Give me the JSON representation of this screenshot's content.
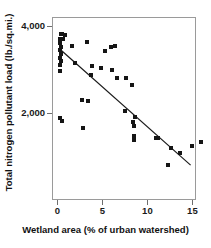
{
  "chart_data": {
    "type": "scatter",
    "title": "",
    "xlabel": "Wetland area (% of urban watershed)",
    "ylabel": "Total nitrogen pollutant load (lb./sq.mi.)",
    "xlim": [
      -0.6,
      15.4
    ],
    "ylim": [
      0,
      4200
    ],
    "xticks": [
      0,
      5,
      10,
      15
    ],
    "xtick_labels": [
      "0",
      "5",
      "10",
      "15"
    ],
    "yticks": [
      2000,
      4000
    ],
    "ytick_labels": [
      "2,000",
      "4,000"
    ],
    "grid": false,
    "legend": null,
    "marker": "square",
    "marker_color": "#151515",
    "frame_color": "#9a9a9a",
    "points": [
      {
        "x": 0.35,
        "y": 3810
      },
      {
        "x": 0.55,
        "y": 3800
      },
      {
        "x": 0.8,
        "y": 3790
      },
      {
        "x": 0.3,
        "y": 3700
      },
      {
        "x": 0.6,
        "y": 3690
      },
      {
        "x": 0.3,
        "y": 3600
      },
      {
        "x": 0.35,
        "y": 3520
      },
      {
        "x": 0.3,
        "y": 3440
      },
      {
        "x": 0.35,
        "y": 3350
      },
      {
        "x": 0.3,
        "y": 3270
      },
      {
        "x": 0.35,
        "y": 3180
      },
      {
        "x": 0.3,
        "y": 3100
      },
      {
        "x": 0.3,
        "y": 2960
      },
      {
        "x": 1.6,
        "y": 3530
      },
      {
        "x": 3.3,
        "y": 3620
      },
      {
        "x": 5.3,
        "y": 3430
      },
      {
        "x": 5.9,
        "y": 3520
      },
      {
        "x": 6.4,
        "y": 3530
      },
      {
        "x": 2.0,
        "y": 3150
      },
      {
        "x": 3.8,
        "y": 3080
      },
      {
        "x": 4.8,
        "y": 3020
      },
      {
        "x": 6.1,
        "y": 2990
      },
      {
        "x": 3.7,
        "y": 2860
      },
      {
        "x": 6.6,
        "y": 2800
      },
      {
        "x": 7.6,
        "y": 2790
      },
      {
        "x": 8.3,
        "y": 2630
      },
      {
        "x": 2.7,
        "y": 2290
      },
      {
        "x": 3.4,
        "y": 2280
      },
      {
        "x": 0.3,
        "y": 1890
      },
      {
        "x": 0.55,
        "y": 1810
      },
      {
        "x": 2.8,
        "y": 1650
      },
      {
        "x": 7.5,
        "y": 2040
      },
      {
        "x": 8.6,
        "y": 1900
      },
      {
        "x": 8.4,
        "y": 1780
      },
      {
        "x": 8.5,
        "y": 1700
      },
      {
        "x": 8.5,
        "y": 1460
      },
      {
        "x": 8.5,
        "y": 1380
      },
      {
        "x": 10.9,
        "y": 1430
      },
      {
        "x": 11.2,
        "y": 1420
      },
      {
        "x": 12.6,
        "y": 1190
      },
      {
        "x": 13.6,
        "y": 1090
      },
      {
        "x": 14.9,
        "y": 1240
      },
      {
        "x": 15.9,
        "y": 1330
      },
      {
        "x": 12.3,
        "y": 800
      }
    ],
    "trendline": {
      "x_start": 0.35,
      "y_start": 3450,
      "x_end": 14.8,
      "y_end": 800,
      "color": "#1a1a1a"
    }
  }
}
